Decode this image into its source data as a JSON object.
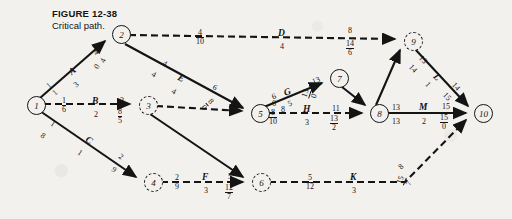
{
  "figure": {
    "number": "FIGURE 12-38",
    "caption": "Critical path."
  },
  "nodes": [
    {
      "id": "1",
      "label": "1",
      "x": 27,
      "y": 104,
      "style": "solid"
    },
    {
      "id": "2",
      "label": "2",
      "x": 112,
      "y": 33,
      "style": "solid"
    },
    {
      "id": "3",
      "label": "3",
      "x": 139,
      "y": 104,
      "style": "dashed"
    },
    {
      "id": "4",
      "label": "4",
      "x": 144,
      "y": 181,
      "style": "dashed"
    },
    {
      "id": "5",
      "label": "5",
      "x": 251,
      "y": 112,
      "style": "solid"
    },
    {
      "id": "6",
      "label": "6",
      "x": 252,
      "y": 181,
      "style": "dashed"
    },
    {
      "id": "7",
      "label": "7",
      "x": 330,
      "y": 77,
      "style": "solid"
    },
    {
      "id": "8",
      "label": "8",
      "x": 370,
      "y": 112,
      "style": "solid"
    },
    {
      "id": "9",
      "label": "9",
      "x": 404,
      "y": 40,
      "style": "dashed"
    },
    {
      "id": "10",
      "label": "10",
      "x": 474,
      "y": 112,
      "style": "solid"
    }
  ],
  "edges": [
    {
      "id": "A",
      "letter": "A",
      "from": "1",
      "to": "2",
      "style": "solid"
    },
    {
      "id": "D",
      "letter": "D",
      "from": "2",
      "to": "9",
      "style": "dashed"
    },
    {
      "id": "E",
      "letter": "E",
      "from": "2",
      "to": "5",
      "style": "solid"
    },
    {
      "id": "B",
      "letter": "B",
      "from": "1",
      "to": "3",
      "style": "dashed"
    },
    {
      "id": "C",
      "letter": "C",
      "from": "1",
      "to": "4",
      "style": "solid"
    },
    {
      "id": "dummy35",
      "letter": "",
      "from": "3",
      "to": "5",
      "style": "dashed"
    },
    {
      "id": "dummy36",
      "letter": "",
      "from": "3",
      "to": "6",
      "style": "solid"
    },
    {
      "id": "F",
      "letter": "F",
      "from": "4",
      "to": "6",
      "style": "dashed"
    },
    {
      "id": "G",
      "letter": "G",
      "from": "5",
      "to": "7",
      "style": "solid"
    },
    {
      "id": "H",
      "letter": "H",
      "from": "5",
      "to": "8",
      "style": "dashed"
    },
    {
      "id": "dummy78",
      "letter": "",
      "from": "7",
      "to": "8",
      "style": "solid"
    },
    {
      "id": "K",
      "letter": "K",
      "from": "6",
      "to": "10",
      "style": "dashed"
    },
    {
      "id": "dummy89",
      "letter": "",
      "from": "8",
      "to": "9",
      "style": "solid"
    },
    {
      "id": "L",
      "letter": "L",
      "from": "9",
      "to": "10",
      "style": "solid"
    },
    {
      "id": "M",
      "letter": "M",
      "from": "8",
      "to": "10",
      "style": "solid"
    }
  ],
  "annotations": {
    "a_head_top": "1",
    "a_head_bottom": "1",
    "a_letter": "A",
    "a_duration": "3",
    "a_tail_top": "4",
    "a_tail_bottom": "4",
    "a_tail_slack": "0",
    "d_early": "4",
    "d_late": "10",
    "d_letter": "D",
    "d_duration": "4",
    "d_tail_top": "8",
    "d_tail_mid": "14",
    "d_tail_bottom": "6",
    "e_head_top": "4",
    "e_head_bottom": "4",
    "e_letter": "E",
    "e_duration": "4",
    "e_tail_top": "6",
    "e_tail_mid": "8",
    "e_tail_bottom": "0",
    "b_head_top": "1",
    "b_head_bottom": "6",
    "b_letter": "B",
    "b_duration": "2",
    "b_tail_top": "3",
    "b_tail_mid": "8",
    "b_tail_bottom": "5",
    "c_head_top": "1",
    "c_head_bottom": "8",
    "c_letter": "C",
    "c_duration": "1",
    "c_tail_top": "2",
    "c_tail_bottom": "9",
    "f_head_top": "2",
    "f_head_bottom": "9",
    "f_letter": "F",
    "f_duration": "3",
    "f_tail_top": "5",
    "f_tail_mid": "12",
    "f_tail_bottom": "7",
    "g_head": "6",
    "g_letter": "G",
    "g_duration": "5",
    "g_tail_top": "13",
    "g_tail_mid": "13",
    "g_tail_bottom": "0",
    "node5_top": "6",
    "node5_mid": "8",
    "node5_bottom": "10",
    "h_letter": "H",
    "h_head_top": "8",
    "h_duration": "3",
    "h_tail_top": "11",
    "h_tail_mid": "13",
    "h_tail_bottom": "2",
    "k_head_top": "5",
    "k_head_bottom": "12",
    "k_letter": "K",
    "k_duration": "3",
    "k_tail_top": "8",
    "k_tail_mid": "15",
    "k_tail_bottom": "7",
    "m_head_top": "13",
    "m_head_bottom": "13",
    "m_letter": "M",
    "m_duration": "2",
    "m_tail_top": "15",
    "m_tail_mid": "15",
    "m_tail_bottom": "0",
    "l_head_top": "13",
    "l_head_bottom": "14",
    "l_letter": "L",
    "l_duration": "1",
    "l_tail_top": "14",
    "l_tail_mid": "15"
  }
}
